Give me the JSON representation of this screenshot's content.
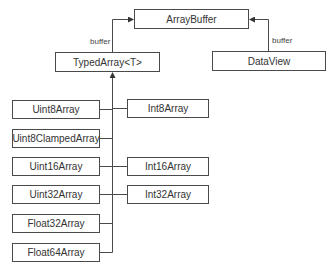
{
  "diagram": {
    "nodes": {
      "array_buffer": "ArrayBuffer",
      "typed_array": "TypedArray<T>",
      "data_view": "DataView",
      "uint8": "Uint8Array",
      "uint8_clamped": "Uint8ClampedArray",
      "uint16": "Uint16Array",
      "uint32": "Uint32Array",
      "float32": "Float32Array",
      "float64": "Float64Array",
      "int8": "Int8Array",
      "int16": "Int16Array",
      "int32": "Int32Array"
    },
    "edge_labels": {
      "typed_to_buffer": "buffer",
      "dataview_to_buffer": "buffer"
    },
    "edges": [
      {
        "from": "TypedArray<T>",
        "to": "ArrayBuffer",
        "label": "buffer"
      },
      {
        "from": "DataView",
        "to": "ArrayBuffer",
        "label": "buffer"
      },
      {
        "from": "Uint8Array",
        "to": "TypedArray<T>"
      },
      {
        "from": "Uint8ClampedArray",
        "to": "TypedArray<T>"
      },
      {
        "from": "Uint16Array",
        "to": "TypedArray<T>"
      },
      {
        "from": "Uint32Array",
        "to": "TypedArray<T>"
      },
      {
        "from": "Float32Array",
        "to": "TypedArray<T>"
      },
      {
        "from": "Float64Array",
        "to": "TypedArray<T>"
      },
      {
        "from": "Int8Array",
        "to": "TypedArray<T>"
      },
      {
        "from": "Int16Array",
        "to": "TypedArray<T>"
      },
      {
        "from": "Int32Array",
        "to": "TypedArray<T>"
      }
    ]
  }
}
